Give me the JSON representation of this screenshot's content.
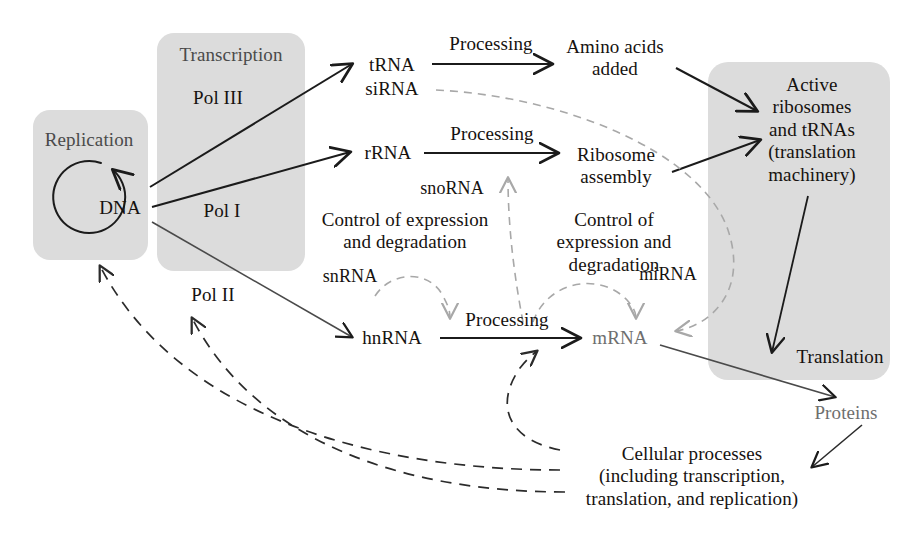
{
  "figure": {
    "type": "biology-flow-diagram",
    "palette": {
      "panel_fill": "#dcdcdc",
      "solid_arrow": "#1b1b1b",
      "dark_dashed_arrow": "#2b2b2b",
      "light_dashed_arrow": "#a8a8a8",
      "text_dark": "#16120f",
      "text_gray": "#6e6e6e",
      "background": "#ffffff"
    }
  },
  "panels": [
    {
      "id": "replication",
      "label": "Replication",
      "x": 33,
      "y": 110,
      "w": 115,
      "h": 150
    },
    {
      "id": "transcription",
      "label": "Transcription",
      "x": 157,
      "y": 33,
      "w": 148,
      "h": 238
    },
    {
      "id": "translation_machinery",
      "label": "",
      "x": 708,
      "y": 62,
      "w": 182,
      "h": 318
    }
  ],
  "nodes": {
    "dna": "DNA",
    "replication": "Replication",
    "transcription": "Transcription",
    "pol_iii": "Pol III",
    "pol_i": "Pol I",
    "pol_ii": "Pol II",
    "trna": "tRNA",
    "sirna": "siRNA",
    "rrna": "rRNA",
    "hnrna": "hnRNA",
    "mrna": "mRNA",
    "snorna": "snoRNA",
    "snrna": "snRNA",
    "mirna": "miRNA",
    "amino_acids_added": "Amino acids\nadded",
    "ribosome_assembly": "Ribosome\nassembly",
    "control_left": "Control of expression\nand degradation",
    "control_right": "Control of\nexpression and\ndegradation",
    "active_ribosomes": "Active\nribosomes\nand tRNAs\n(translation\nmachinery)",
    "translation": "Translation",
    "proteins": "Proteins",
    "cellular_processes": "Cellular processes\n(including transcription,\ntranslation, and replication)"
  },
  "edge_labels": {
    "processing_trna": "Processing",
    "processing_rrna": "Processing",
    "processing_hnrna": "Processing"
  },
  "edges": [
    {
      "from": "DNA",
      "to": "tRNA",
      "label": "Pol III",
      "style": "solid"
    },
    {
      "from": "DNA",
      "to": "rRNA",
      "label": "Pol I",
      "style": "solid"
    },
    {
      "from": "DNA",
      "to": "hnRNA",
      "label": "Pol II",
      "style": "solid"
    },
    {
      "from": "tRNA",
      "to": "Amino acids added",
      "label": "Processing",
      "style": "solid"
    },
    {
      "from": "rRNA",
      "to": "Ribosome assembly",
      "label": "Processing",
      "style": "solid"
    },
    {
      "from": "hnRNA",
      "to": "mRNA",
      "label": "Processing",
      "style": "solid"
    },
    {
      "from": "Amino acids added",
      "to": "Active ribosomes and tRNAs",
      "label": "",
      "style": "solid"
    },
    {
      "from": "Ribosome assembly",
      "to": "Active ribosomes and tRNAs",
      "label": "",
      "style": "solid"
    },
    {
      "from": "Active ribosomes and tRNAs",
      "to": "Translation",
      "label": "",
      "style": "solid"
    },
    {
      "from": "mRNA",
      "to": "Proteins",
      "label": "",
      "style": "solid"
    },
    {
      "from": "Proteins",
      "to": "Cellular processes",
      "label": "",
      "style": "solid"
    },
    {
      "from": "snRNA",
      "to": "hnRNA",
      "label": "",
      "style": "dashed-light"
    },
    {
      "from": "snoRNA",
      "to": "rRNA",
      "label": "",
      "style": "dashed-light"
    },
    {
      "from": "miRNA",
      "to": "mRNA",
      "label": "",
      "style": "dashed-light"
    },
    {
      "from": "siRNA",
      "to": "mRNA",
      "label": "",
      "style": "dashed-light"
    },
    {
      "from": "Cellular processes",
      "to": "Replication",
      "label": "",
      "style": "dashed-dark"
    },
    {
      "from": "Cellular processes",
      "to": "Pol II",
      "label": "",
      "style": "dashed-dark"
    },
    {
      "from": "Cellular processes",
      "to": "Processing (hnRNA to mRNA)",
      "label": "",
      "style": "dashed-dark"
    },
    {
      "from": "DNA",
      "to": "DNA",
      "label": "Replication loop",
      "style": "solid-circular"
    }
  ]
}
